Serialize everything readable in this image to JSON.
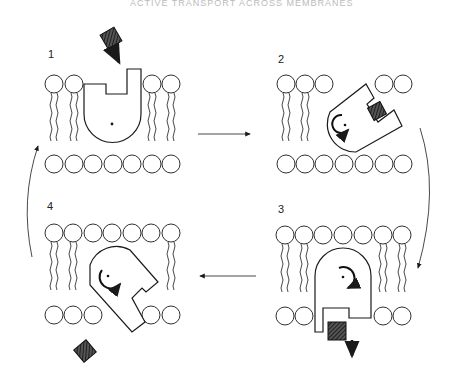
{
  "header": {
    "text": "ACTIVE TRANSPORT ACROSS MEMBRANES"
  },
  "panels": [
    {
      "number": "1",
      "state": "carrier open to outside, solute approaching"
    },
    {
      "number": "2",
      "state": "solute bound, carrier rotating"
    },
    {
      "number": "3",
      "state": "carrier open to inside, solute released"
    },
    {
      "number": "4",
      "state": "carrier rotating back, empty"
    }
  ],
  "colors": {
    "line": "#1a1a1a",
    "solute": "#333333",
    "background": "#ffffff"
  }
}
